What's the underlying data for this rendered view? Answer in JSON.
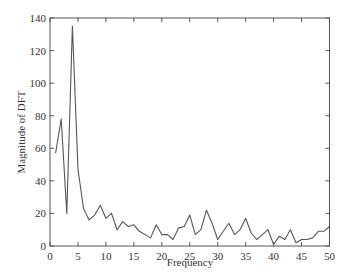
{
  "chart_data": {
    "type": "line",
    "title": "",
    "xlabel": "Frequency",
    "ylabel": "Magnitude of DFT",
    "xlim": [
      0,
      50
    ],
    "ylim": [
      0,
      140
    ],
    "xticks": [
      0,
      5,
      10,
      15,
      20,
      25,
      30,
      35,
      40,
      45,
      50
    ],
    "yticks": [
      0,
      20,
      40,
      60,
      80,
      100,
      120,
      140
    ],
    "grid": false,
    "legend": null,
    "line_color": "#555555",
    "series": [
      {
        "name": "DFT magnitude",
        "x": [
          1,
          2,
          3,
          4,
          5,
          6,
          7,
          8,
          9,
          10,
          11,
          12,
          13,
          14,
          15,
          16,
          17,
          18,
          19,
          20,
          21,
          22,
          23,
          24,
          25,
          26,
          27,
          28,
          29,
          30,
          31,
          32,
          33,
          34,
          35,
          36,
          37,
          38,
          39,
          40,
          41,
          42,
          43,
          44,
          45,
          46,
          47,
          48,
          49,
          50
        ],
        "values": [
          57,
          78,
          20,
          135,
          47,
          23,
          16,
          19,
          25,
          17,
          20,
          10,
          15,
          12,
          13,
          9,
          7,
          5,
          13,
          7,
          7,
          4,
          11,
          12,
          19,
          7,
          10,
          22,
          14,
          4,
          9,
          14,
          7,
          10,
          17,
          8,
          4,
          7,
          10,
          1,
          6,
          4,
          10,
          2,
          4,
          4,
          5,
          9,
          9,
          12
        ]
      }
    ]
  }
}
